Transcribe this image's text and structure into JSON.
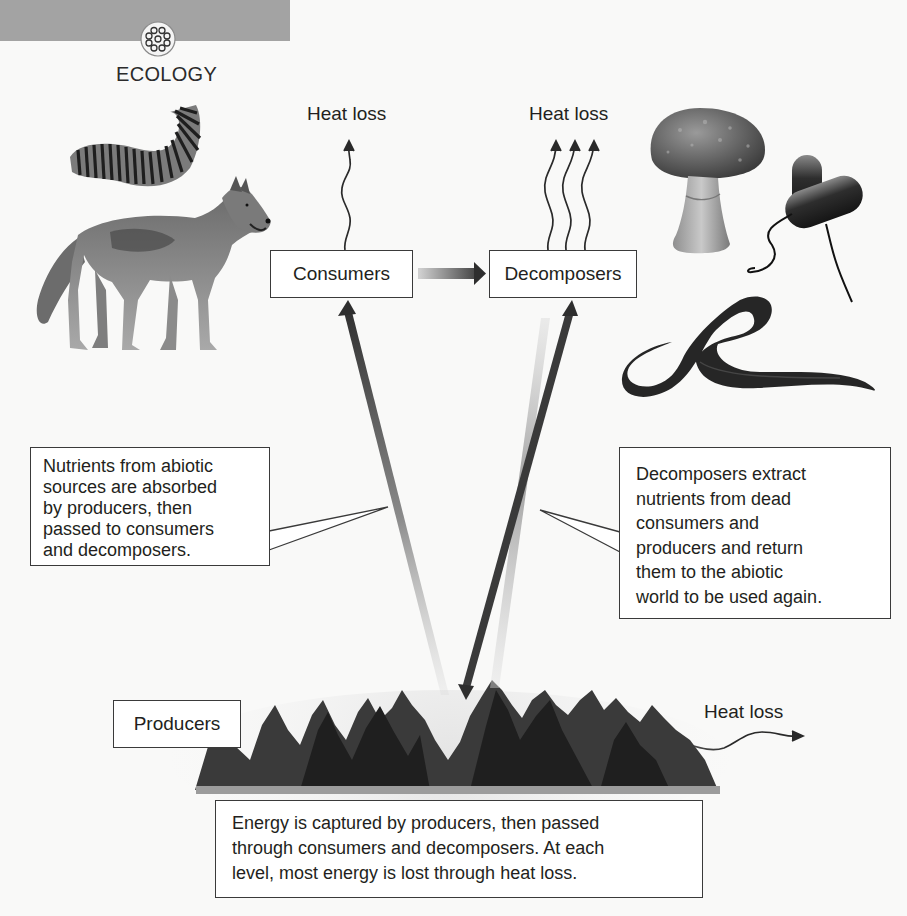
{
  "header": {
    "section_label": "ECOLOGY",
    "badge_icon": "molecule-cluster-icon",
    "tab_color": "#a3a3a3"
  },
  "diagram": {
    "nodes": {
      "consumers": "Consumers",
      "decomposers": "Decomposers",
      "producers": "Producers"
    },
    "heat_loss_labels": {
      "consumers": "Heat loss",
      "decomposers": "Heat loss",
      "producers": "Heat loss"
    },
    "heat_loss_arrow_counts": {
      "consumers": 1,
      "decomposers": 3,
      "producers": 1
    },
    "callouts": {
      "nutrients_left": {
        "lines": [
          "Nutrients from abiotic",
          "sources are absorbed",
          "by producers, then",
          "passed to consumers",
          "and decomposers."
        ]
      },
      "decomposers_right": {
        "lines": [
          "Decomposers extract",
          "nutrients from dead",
          "consumers and",
          "producers and return",
          "them to the abiotic",
          "world to be used again."
        ]
      },
      "energy_bottom": {
        "lines": [
          "Energy is captured by producers, then passed",
          "through consumers and decomposers. At each",
          "level, most energy is lost through heat loss."
        ]
      }
    },
    "flows": [
      {
        "from": "Producers",
        "to": "Consumers",
        "type": "energy+nutrients"
      },
      {
        "from": "Consumers",
        "to": "Decomposers",
        "type": "energy+nutrients"
      },
      {
        "from": "Producers",
        "to": "Decomposers",
        "type": "energy+nutrients"
      },
      {
        "from": "Decomposers",
        "to": "Producers",
        "type": "nutrients returned"
      }
    ],
    "illustrations": {
      "consumers": [
        "caterpillar",
        "wolf"
      ],
      "decomposers": [
        "mushroom",
        "bacteria",
        "earthworm"
      ],
      "producers": [
        "conifer forest"
      ]
    }
  }
}
